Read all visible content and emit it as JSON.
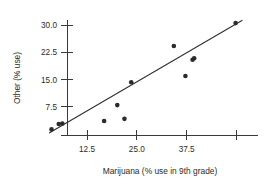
{
  "chart_data": {
    "type": "scatter",
    "title": "",
    "xlabel": "Marijuana (% use in 9th grade)",
    "ylabel": "Other (% use)",
    "xlim": [
      2.0,
      53.0
    ],
    "ylim": [
      0.0,
      33.0
    ],
    "grid": false,
    "legend": null,
    "xticks": [
      12.5,
      25.0,
      37.5,
      50.0
    ],
    "xtick_labels": [
      "12.5",
      "25.0",
      "37.5",
      ""
    ],
    "yticks": [
      7.5,
      15.0,
      22.5,
      30.0
    ],
    "ytick_labels": [
      "7.5",
      "15.0",
      "22.5",
      "30.0"
    ],
    "points": [
      {
        "x": 3.6,
        "y": 1.3
      },
      {
        "x": 5.4,
        "y": 2.8
      },
      {
        "x": 6.3,
        "y": 2.9
      },
      {
        "x": 16.8,
        "y": 3.6
      },
      {
        "x": 21.9,
        "y": 4.2
      },
      {
        "x": 20.1,
        "y": 8.0
      },
      {
        "x": 23.6,
        "y": 14.3
      },
      {
        "x": 34.3,
        "y": 24.3
      },
      {
        "x": 37.2,
        "y": 16.0
      },
      {
        "x": 39.0,
        "y": 20.5
      },
      {
        "x": 39.4,
        "y": 20.9
      },
      {
        "x": 49.8,
        "y": 30.6
      }
    ],
    "fit_line": {
      "type": "linear-regression",
      "x_start": 3.0,
      "y_start": 0.3,
      "x_end": 51.5,
      "y_end": 31.4
    }
  },
  "axes": {
    "x_axis_name": "x-axis",
    "y_axis_name": "y-axis"
  }
}
